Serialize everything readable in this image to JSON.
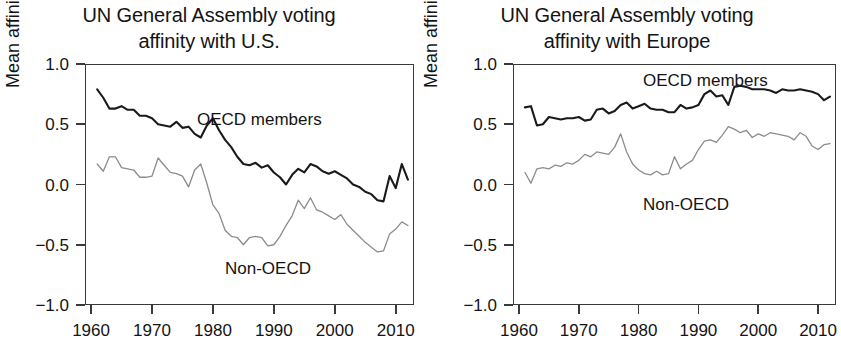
{
  "figure": {
    "ylabel": "Mean affinity index score",
    "series_colors": {
      "oecd": "#1a1a1a",
      "non_oecd": "#8c8c8c"
    }
  },
  "panels": [
    {
      "id": "left",
      "title_line1": "UN General Assembly voting",
      "title_line2": "affinity with U.S.",
      "ylabel": "Mean affinity index score",
      "series_label_oecd": "OECD members",
      "series_label_non_oecd": "Non-OECD"
    },
    {
      "id": "right",
      "title_line1": "UN General Assembly voting",
      "title_line2": "affinity with Europe",
      "ylabel": "Mean affinity index score",
      "series_label_oecd": "OECD members",
      "series_label_non_oecd": "Non-OECD"
    }
  ],
  "ticks": {
    "y_labels": [
      "1.0",
      "0.5",
      "0.0",
      "−0.5",
      "−1.0"
    ],
    "y_values": [
      1.0,
      0.5,
      0.0,
      -0.5,
      -1.0
    ],
    "x_labels": [
      "1960",
      "1970",
      "1980",
      "1990",
      "2000",
      "2010"
    ],
    "x_values": [
      1960,
      1970,
      1980,
      1990,
      2000,
      2010
    ]
  },
  "chart_data": [
    {
      "type": "line",
      "title": "UN General Assembly voting affinity with U.S.",
      "xlabel": "",
      "ylabel": "Mean affinity index score",
      "xlim": [
        1959,
        2013
      ],
      "ylim": [
        -1.0,
        1.0
      ],
      "grid": false,
      "legend": "inline annotations",
      "x": [
        1961,
        1962,
        1963,
        1964,
        1965,
        1966,
        1967,
        1968,
        1969,
        1970,
        1971,
        1972,
        1973,
        1974,
        1975,
        1976,
        1977,
        1978,
        1979,
        1980,
        1981,
        1982,
        1983,
        1984,
        1985,
        1986,
        1987,
        1988,
        1989,
        1990,
        1991,
        1992,
        1993,
        1994,
        1995,
        1996,
        1997,
        1998,
        1999,
        2000,
        2001,
        2002,
        2003,
        2004,
        2005,
        2006,
        2007,
        2008,
        2009,
        2010,
        2011,
        2012
      ],
      "series": [
        {
          "name": "OECD members",
          "color": "#1a1a1a",
          "values": [
            0.79,
            0.72,
            0.63,
            0.63,
            0.65,
            0.62,
            0.62,
            0.57,
            0.57,
            0.55,
            0.5,
            0.49,
            0.48,
            0.52,
            0.47,
            0.48,
            0.42,
            0.39,
            0.49,
            0.55,
            0.45,
            0.37,
            0.31,
            0.23,
            0.17,
            0.16,
            0.18,
            0.14,
            0.16,
            0.1,
            0.06,
            0.0,
            0.08,
            0.13,
            0.1,
            0.17,
            0.15,
            0.11,
            0.09,
            0.11,
            0.08,
            0.05,
            0.0,
            -0.02,
            -0.06,
            -0.08,
            -0.13,
            -0.14,
            0.07,
            -0.03,
            0.17,
            0.04
          ]
        },
        {
          "name": "Non-OECD",
          "color": "#8c8c8c",
          "values": [
            0.17,
            0.11,
            0.23,
            0.23,
            0.14,
            0.13,
            0.12,
            0.06,
            0.06,
            0.07,
            0.22,
            0.16,
            0.1,
            0.09,
            0.07,
            -0.02,
            0.12,
            0.17,
            0.01,
            -0.17,
            -0.24,
            -0.38,
            -0.43,
            -0.44,
            -0.5,
            -0.44,
            -0.43,
            -0.44,
            -0.51,
            -0.5,
            -0.43,
            -0.34,
            -0.26,
            -0.13,
            -0.2,
            -0.11,
            -0.21,
            -0.23,
            -0.26,
            -0.29,
            -0.25,
            -0.33,
            -0.38,
            -0.43,
            -0.48,
            -0.52,
            -0.56,
            -0.55,
            -0.41,
            -0.37,
            -0.31,
            -0.34
          ]
        }
      ]
    },
    {
      "type": "line",
      "title": "UN General Assembly voting affinity with Europe",
      "xlabel": "",
      "ylabel": "Mean affinity index score",
      "xlim": [
        1959,
        2013
      ],
      "ylim": [
        -1.0,
        1.0
      ],
      "grid": false,
      "legend": "inline annotations",
      "x": [
        1961,
        1962,
        1963,
        1964,
        1965,
        1966,
        1967,
        1968,
        1969,
        1970,
        1971,
        1972,
        1973,
        1974,
        1975,
        1976,
        1977,
        1978,
        1979,
        1980,
        1981,
        1982,
        1983,
        1984,
        1985,
        1986,
        1987,
        1988,
        1989,
        1990,
        1991,
        1992,
        1993,
        1994,
        1995,
        1996,
        1997,
        1998,
        1999,
        2000,
        2001,
        2002,
        2003,
        2004,
        2005,
        2006,
        2007,
        2008,
        2009,
        2010,
        2011,
        2012
      ],
      "series": [
        {
          "name": "OECD members",
          "color": "#1a1a1a",
          "values": [
            0.64,
            0.65,
            0.49,
            0.5,
            0.56,
            0.55,
            0.54,
            0.55,
            0.55,
            0.56,
            0.53,
            0.54,
            0.62,
            0.63,
            0.59,
            0.61,
            0.66,
            0.68,
            0.63,
            0.65,
            0.67,
            0.63,
            0.62,
            0.62,
            0.6,
            0.6,
            0.66,
            0.63,
            0.64,
            0.66,
            0.75,
            0.78,
            0.73,
            0.74,
            0.66,
            0.81,
            0.82,
            0.81,
            0.79,
            0.79,
            0.79,
            0.78,
            0.76,
            0.79,
            0.78,
            0.78,
            0.79,
            0.78,
            0.77,
            0.75,
            0.7,
            0.73
          ]
        },
        {
          "name": "Non-OECD",
          "color": "#8c8c8c",
          "values": [
            0.1,
            0.01,
            0.13,
            0.14,
            0.13,
            0.16,
            0.15,
            0.18,
            0.17,
            0.2,
            0.25,
            0.23,
            0.27,
            0.26,
            0.25,
            0.31,
            0.42,
            0.27,
            0.17,
            0.12,
            0.09,
            0.08,
            0.11,
            0.08,
            0.09,
            0.23,
            0.13,
            0.17,
            0.2,
            0.29,
            0.36,
            0.37,
            0.35,
            0.41,
            0.48,
            0.46,
            0.43,
            0.45,
            0.39,
            0.42,
            0.4,
            0.43,
            0.42,
            0.41,
            0.4,
            0.37,
            0.43,
            0.4,
            0.32,
            0.29,
            0.33,
            0.34
          ]
        }
      ]
    }
  ]
}
